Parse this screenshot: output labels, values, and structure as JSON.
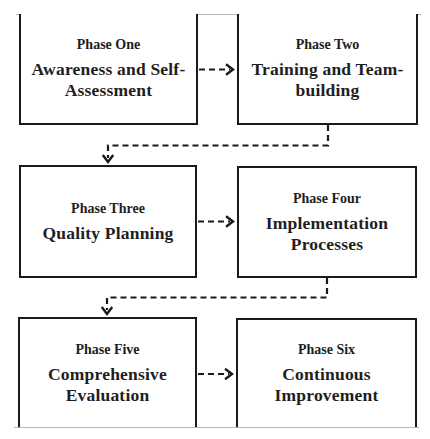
{
  "diagram": {
    "colors": {
      "stroke": "#1a1a1a",
      "frame": "#b8b8b8",
      "background": "#ffffff"
    },
    "phases": [
      {
        "label": "Phase One",
        "title_lines": [
          "Awareness and Self-",
          "Assessment"
        ]
      },
      {
        "label": "Phase Two",
        "title_lines": [
          "Training and Team-",
          "building"
        ]
      },
      {
        "label": "Phase Three",
        "title_lines": [
          "Quality Planning"
        ]
      },
      {
        "label": "Phase Four",
        "title_lines": [
          "Implementation",
          "Processes"
        ]
      },
      {
        "label": "Phase Five",
        "title_lines": [
          "Comprehensive",
          "Evaluation"
        ]
      },
      {
        "label": "Phase Six",
        "title_lines": [
          "Continuous",
          "Improvement"
        ]
      }
    ],
    "flow": [
      {
        "from": "Phase One",
        "to": "Phase Two",
        "style": "dashed-arrow"
      },
      {
        "from": "Phase Two",
        "to": "Phase Three",
        "style": "dashed-elbow-arrow"
      },
      {
        "from": "Phase Three",
        "to": "Phase Four",
        "style": "dashed-arrow"
      },
      {
        "from": "Phase Four",
        "to": "Phase Five",
        "style": "dashed-elbow-arrow"
      },
      {
        "from": "Phase Five",
        "to": "Phase Six",
        "style": "dashed-arrow"
      }
    ]
  }
}
